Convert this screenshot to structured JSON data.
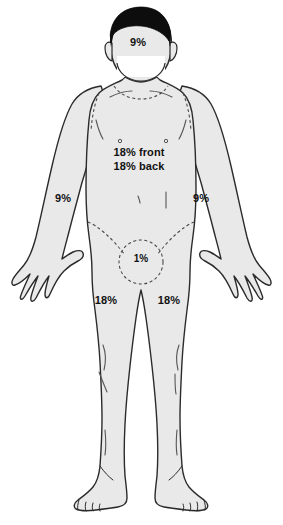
{
  "diagram": {
    "figure_name": "anterior-adult-male-body",
    "colors": {
      "skin_fill": "#e9e9e9",
      "outline": "#2b2b2b",
      "hair": "#0d0d0d",
      "detail_line": "#555555",
      "dashed_line": "#4a4a4a",
      "background": "#ffffff",
      "label_text": "#111111",
      "mask_fill": "#ffffff"
    },
    "regions": [
      {
        "name": "head-and-neck",
        "label": "9%",
        "value": 9,
        "position": "head"
      },
      {
        "name": "trunk",
        "label_line1": "18% front",
        "label_line2": "18% back",
        "value_front": 18,
        "value_back": 18,
        "position": "torso"
      },
      {
        "name": "right-arm",
        "label": "9%",
        "value": 9,
        "position": "arm-left-of-image"
      },
      {
        "name": "left-arm",
        "label": "9%",
        "value": 9,
        "position": "arm-right-of-image"
      },
      {
        "name": "perineum-groin",
        "label": "1%",
        "value": 1,
        "position": "groin"
      },
      {
        "name": "right-leg",
        "label": "18%",
        "value": 18,
        "position": "leg-left-of-image"
      },
      {
        "name": "left-leg",
        "label": "18%",
        "value": 18,
        "position": "leg-right-of-image"
      }
    ],
    "labels": {
      "head": "9%",
      "torso_front": "18% front",
      "torso_back": "18% back",
      "arm_left": "9%",
      "arm_right": "9%",
      "groin": "1%",
      "leg_left": "18%",
      "leg_right": "18%"
    }
  }
}
